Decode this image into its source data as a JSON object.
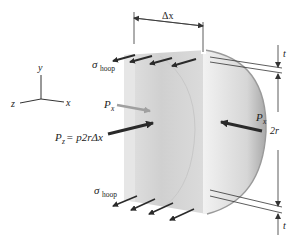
{
  "diagram": {
    "type": "free-body diagram",
    "axes": {
      "y": "y",
      "z": "z",
      "x": "x"
    },
    "labels": {
      "delta_x": "Δx",
      "sigma": "σ",
      "hoop_sub": "hoop",
      "p_x_left_P": "P",
      "p_x_left_sub": "x",
      "p_x_right_P": "P",
      "p_x_right_sub": "x",
      "pz_P": "P",
      "pz_sub": "z",
      "pz_eq": " = p2rΔx",
      "t_top": "t",
      "two_r": "2r",
      "t_bottom": "t"
    },
    "colors": {
      "arrow_dark": "#2a2a2a",
      "arrow_light": "#a0a0a0",
      "shade_light": "#e8e8e8",
      "shade_mid": "#d4d4d4",
      "shade_dark": "#bdbdbd",
      "dimension_line": "#333333"
    }
  }
}
